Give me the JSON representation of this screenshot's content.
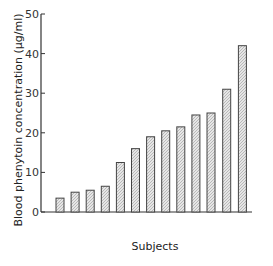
{
  "chart_data": {
    "type": "bar",
    "title": "",
    "xlabel": "Subjects",
    "ylabel": "Blood phenytoin concentration (µg/ml)",
    "ylim": [
      0,
      50
    ],
    "yticks": [
      0,
      10,
      20,
      30,
      40,
      50
    ],
    "grid": false,
    "legend": null,
    "categories": [
      "1",
      "2",
      "3",
      "4",
      "5",
      "6",
      "7",
      "8",
      "9",
      "10",
      "11",
      "12",
      "13"
    ],
    "values": [
      3.5,
      5,
      5.5,
      6.5,
      12.5,
      16,
      19,
      20.5,
      21.5,
      24.5,
      25,
      31,
      42
    ],
    "bar_style": "hatched-light-gray"
  },
  "colors": {
    "axis": "#333333",
    "bar_stroke": "#444444",
    "bar_fill": "#d6d6d6"
  }
}
